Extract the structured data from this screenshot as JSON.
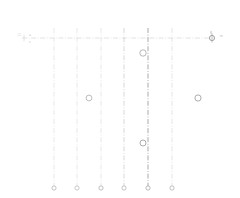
{
  "drawing": {
    "title": "centerline-layout",
    "width": 240,
    "height": 198,
    "background": "#ffffff",
    "colors": {
      "centerline_light": "#d8d8de",
      "centerline_mid": "#c4c4cc",
      "centerline_dark": "#8f8f98",
      "horizontal_line": "#d2d2d8",
      "circle_stroke": "#9a9aa3",
      "node_stroke": "#a8a8b0",
      "text": "#bcbcc1"
    },
    "horizontal_axis": {
      "label": "horizontal-centerline",
      "y": 38,
      "x_start": 22,
      "x_end": 214,
      "style": "dash-dot"
    },
    "vertical_lines": [
      {
        "id": "v1",
        "x": 54,
        "y_top": 28,
        "y_bottom": 186,
        "weight": "light"
      },
      {
        "id": "v2",
        "x": 77,
        "y_top": 28,
        "y_bottom": 186,
        "weight": "light"
      },
      {
        "id": "v3",
        "x": 101,
        "y_top": 28,
        "y_bottom": 186,
        "weight": "light"
      },
      {
        "id": "v4",
        "x": 124,
        "y_top": 28,
        "y_bottom": 186,
        "weight": "mid"
      },
      {
        "id": "v5",
        "x": 148,
        "y_top": 28,
        "y_bottom": 186,
        "weight": "dark"
      },
      {
        "id": "v6",
        "x": 172,
        "y_top": 28,
        "y_bottom": 186,
        "weight": "light"
      }
    ],
    "base_nodes": [
      {
        "id": "n1",
        "cx": 54,
        "cy": 188,
        "r": 2.1
      },
      {
        "id": "n2",
        "cx": 77,
        "cy": 188,
        "r": 2.1
      },
      {
        "id": "n3",
        "cx": 101,
        "cy": 188,
        "r": 2.1
      },
      {
        "id": "n4",
        "cx": 124,
        "cy": 188,
        "r": 2.1
      },
      {
        "id": "n5",
        "cx": 148,
        "cy": 188,
        "r": 2.1
      },
      {
        "id": "n6",
        "cx": 172,
        "cy": 188,
        "r": 2.1
      }
    ],
    "markers": [
      {
        "id": "m1",
        "cx": 143,
        "cy": 53,
        "r": 3.2
      },
      {
        "id": "m2",
        "cx": 89,
        "cy": 98,
        "r": 2.9
      },
      {
        "id": "m3",
        "cx": 198,
        "cy": 98,
        "r": 3.1
      },
      {
        "id": "m4",
        "cx": 143,
        "cy": 143,
        "r": 3.0
      }
    ],
    "end_marker": {
      "id": "axis-end-node",
      "cx": 212,
      "cy": 38,
      "r": 2.6
    }
  },
  "labels": {
    "left_id": "□",
    "left_dim": "=",
    "left_sub": "s",
    "right_dim": "8",
    "right_unit": "m"
  }
}
